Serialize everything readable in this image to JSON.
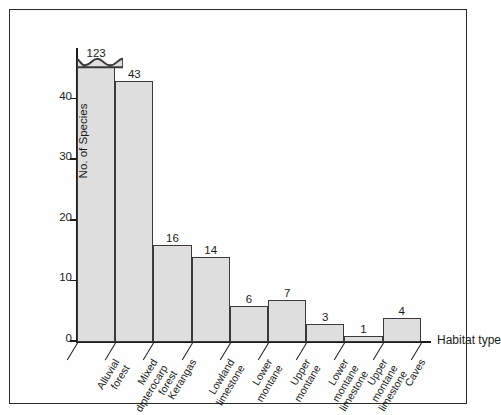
{
  "chart_data": {
    "type": "bar",
    "title": "",
    "xlabel": "Habitat type",
    "ylabel": "No. of Species",
    "ylim": [
      0,
      48
    ],
    "yticks": [
      0,
      10,
      20,
      30,
      40
    ],
    "grid": false,
    "legend": null,
    "axis_break_note": "First bar is truncated with a wavy break symbol; its true value is 123",
    "categories": [
      "Alluvial forest",
      "Mixed dipterocarp forest",
      "Kerangas",
      "Lowland limestone",
      "Lower montane",
      "Upper montane",
      "Lower montane limestone",
      "Upper montane limestone",
      "Caves"
    ],
    "values": [
      123,
      43,
      16,
      14,
      6,
      7,
      3,
      1,
      4
    ],
    "labels": [
      "123",
      "43",
      "16",
      "14",
      "6",
      "7",
      "3",
      "1",
      "4"
    ],
    "category_lines": [
      [
        "Alluvial",
        "forest"
      ],
      [
        "Mixed",
        "dipterocarp",
        "forest"
      ],
      [
        "Kerangas"
      ],
      [
        "Lowland",
        "limestone"
      ],
      [
        "Lower",
        "montane"
      ],
      [
        "Upper",
        "montane"
      ],
      [
        "Lower",
        "montane",
        "limestone"
      ],
      [
        "Upper",
        "montane",
        "limestone"
      ],
      [
        "Caves"
      ]
    ]
  },
  "style": {
    "bar_fill": "#dedede",
    "bar_stroke": "#3a3a3a",
    "axis_color": "#1c1c1c",
    "frame_color": "#2b2b2b",
    "background": "#ffffff"
  }
}
